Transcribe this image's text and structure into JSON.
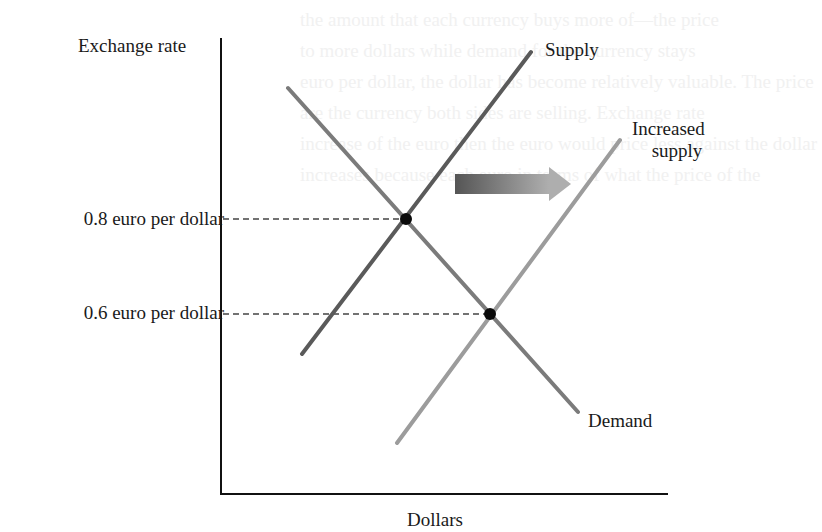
{
  "diagram": {
    "type": "supply-demand",
    "axes": {
      "y_label": "Exchange rate",
      "x_label": "Dollars",
      "y_ticks": [
        {
          "label": "0.8 euro per dollar",
          "value": 0.8
        },
        {
          "label": "0.6 euro per dollar",
          "value": 0.6
        }
      ]
    },
    "curves": {
      "supply": {
        "label": "Supply",
        "color": "#5a5a5a"
      },
      "increased_supply": {
        "label_line1": "Increased",
        "label_line2": "supply",
        "color": "#9a9a9a"
      },
      "demand": {
        "label": "Demand",
        "color": "#7a7a7a"
      }
    },
    "equilibria": [
      {
        "name": "initial",
        "rate": "0.8 euro per dollar"
      },
      {
        "name": "new",
        "rate": "0.6 euro per dollar"
      }
    ],
    "shift_arrow": {
      "direction": "right",
      "meaning": "supply increases"
    },
    "colors": {
      "axis": "#111111",
      "dashed": "#333333",
      "point": "#0a0a0a",
      "arrow_start": "#555555",
      "arrow_end": "#aaaaaa"
    }
  },
  "background_text": [
    "the amount that each currency buys more of—the price",
    "to more dollars while demand for the currency stays",
    "euro per dollar, the dollar has become relatively valuable. The price",
    "are the currency both sides are selling. Exchange rate",
    "increase of the euro then the euro would price less against the dollar",
    "increases because each euro in terms of what the price of the"
  ]
}
